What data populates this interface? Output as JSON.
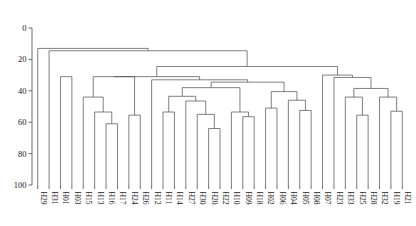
{
  "chart_data": {
    "type": "dendrogram",
    "title": "",
    "xlabel": "",
    "ylabel": "",
    "ylim": [
      0,
      100
    ],
    "y_inverted": true,
    "grid": false,
    "legend": "none",
    "yticks": [
      "0",
      "20",
      "40",
      "60",
      "80",
      "100"
    ],
    "ytick_values": [
      0,
      20,
      40,
      60,
      80,
      100
    ],
    "leaf_labels": [
      "H29",
      "H31",
      "H01",
      "H03",
      "H15",
      "H13",
      "H16",
      "H17",
      "H24",
      "H26",
      "H12",
      "H11",
      "H14",
      "H27",
      "H30",
      "H20",
      "H22",
      "H10",
      "H09",
      "H18",
      "H02",
      "H06",
      "H04",
      "H05",
      "H08",
      "H07",
      "H23",
      "H33",
      "H25",
      "H28",
      "H32",
      "H19",
      "H21"
    ],
    "n_leaves": 33,
    "merges": [
      {
        "id": "m1",
        "left": "H01",
        "right": "H03",
        "height": 31.0
      },
      {
        "id": "m2",
        "left": "H16",
        "right": "H17",
        "height": 61.0
      },
      {
        "id": "m3",
        "left": "H13",
        "right": "m2",
        "height": 53.5
      },
      {
        "id": "m4",
        "left": "H15",
        "right": "m3",
        "height": 44.0
      },
      {
        "id": "m5",
        "left": "H24",
        "right": "H26",
        "height": 55.5
      },
      {
        "id": "m6",
        "left": "m4",
        "right": "m5",
        "height": 31.0
      },
      {
        "id": "m7",
        "left": "H11",
        "right": "H14",
        "height": 53.5
      },
      {
        "id": "m8",
        "left": "H20",
        "right": "H22",
        "height": 64.0
      },
      {
        "id": "m9",
        "left": "H30",
        "right": "m8",
        "height": 55.0
      },
      {
        "id": "m10",
        "left": "H27",
        "right": "m9",
        "height": 46.5
      },
      {
        "id": "m11",
        "left": "m7",
        "right": "m10",
        "height": 43.5
      },
      {
        "id": "m12",
        "left": "H09",
        "right": "H18",
        "height": 56.5
      },
      {
        "id": "m13",
        "left": "H10",
        "right": "m12",
        "height": 53.5
      },
      {
        "id": "m14",
        "left": "m11",
        "right": "m13",
        "height": 38.0
      },
      {
        "id": "m15",
        "left": "H05",
        "right": "H08",
        "height": 52.5
      },
      {
        "id": "m16",
        "left": "H04",
        "right": "m15",
        "height": 46.0
      },
      {
        "id": "m17",
        "left": "H02",
        "right": "H06",
        "height": 51.0
      },
      {
        "id": "m18",
        "left": "m17",
        "right": "m16",
        "height": 40.5
      },
      {
        "id": "m19",
        "left": "m14",
        "right": "m18",
        "height": 34.5
      },
      {
        "id": "m20",
        "left": "H12",
        "right": "m19",
        "height": 33.0
      },
      {
        "id": "m21",
        "left": "m6",
        "right": "m20",
        "height": 31.0
      },
      {
        "id": "m22",
        "left": "H19",
        "right": "H21",
        "height": 53.0
      },
      {
        "id": "m23",
        "left": "H32",
        "right": "m22",
        "height": 44.0
      },
      {
        "id": "m24",
        "left": "H25",
        "right": "H28",
        "height": 55.5
      },
      {
        "id": "m25",
        "left": "H33",
        "right": "m24",
        "height": 44.0
      },
      {
        "id": "m26",
        "left": "m25",
        "right": "m23",
        "height": 38.5
      },
      {
        "id": "m27",
        "left": "H23",
        "right": "m26",
        "height": 31.5
      },
      {
        "id": "m28",
        "left": "H07",
        "right": "m27",
        "height": 30.0
      },
      {
        "id": "m29",
        "left": "m21",
        "right": "m28",
        "height": 24.5
      },
      {
        "id": "m30",
        "left": "H31",
        "right": "m29",
        "height": 14.5
      },
      {
        "id": "m31",
        "left": "H29",
        "right": "m30",
        "height": 13.0
      }
    ],
    "colors": {
      "line": "#4a4a4a",
      "axis": "#4a4a4a",
      "text": "#1a1a1a",
      "background": "#ffffff"
    }
  }
}
